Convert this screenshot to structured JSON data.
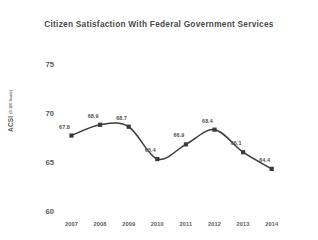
{
  "chart_data": {
    "type": "line",
    "title": "Citizen Satisfaction With Federal Government Services",
    "xlabel": "",
    "ylabel": "ACSI",
    "ylabel_sub": "(0-100 Scale)",
    "categories": [
      "2007",
      "2008",
      "2009",
      "2010",
      "2011",
      "2012",
      "2013",
      "2014"
    ],
    "values": [
      67.8,
      68.9,
      68.7,
      65.4,
      66.9,
      68.4,
      66.1,
      64.4
    ],
    "value_labels": [
      "67.8",
      "68.9",
      "68.7",
      "65.4",
      "66.9",
      "68.4",
      "66.1",
      "64.4"
    ],
    "ylim": [
      60,
      75
    ],
    "yticks": [
      75,
      70,
      65,
      60
    ],
    "ytick_labels": [
      "75",
      "70",
      "65",
      "60"
    ],
    "grid": false,
    "legend": false,
    "series_color": "#3b3b3b",
    "marker": "square",
    "title_color": "#4a4a4a",
    "background": "#ffffff"
  }
}
